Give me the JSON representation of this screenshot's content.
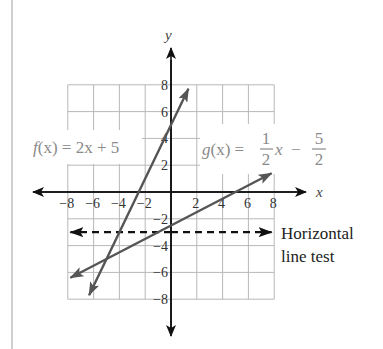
{
  "chart_data": {
    "type": "line",
    "title": "",
    "xlabel": "x",
    "ylabel": "y",
    "xlim": [
      -8,
      8
    ],
    "ylim": [
      -8,
      8
    ],
    "grid": true,
    "x_ticks": [
      "-8",
      "-6",
      "-4",
      "-2",
      "2",
      "4",
      "6",
      "8"
    ],
    "y_ticks": [
      "8",
      "6",
      "4",
      "2",
      "-2",
      "-4",
      "-6",
      "-8"
    ],
    "series": [
      {
        "name": "f(x) = 2x + 5",
        "slope": 2,
        "intercept": 5,
        "x_range": [
          -6.35,
          1.35
        ],
        "style": "solid arrows"
      },
      {
        "name": "g(x) = 1/2 x - 5/2",
        "slope": 0.5,
        "intercept": -2.5,
        "x_range": [
          -7.8,
          7.8
        ],
        "style": "solid arrows"
      },
      {
        "name": "Horizontal line test",
        "y": -3,
        "x_range": [
          -7.8,
          7.8
        ],
        "style": "dashed arrows"
      }
    ],
    "annotations": [
      {
        "text": "f(x) = 2x + 5",
        "position": "upper-left"
      },
      {
        "text": "g(x) = 1/2 x - 5/2",
        "position": "upper-right"
      },
      {
        "text": "Horizontal line test",
        "position": "right of dashed line"
      }
    ]
  },
  "labels": {
    "x_axis": "x",
    "y_axis": "y",
    "f_prefix": "f",
    "f_arg": "(x)",
    "f_rest": " = 2x + 5",
    "g_prefix": "g",
    "g_arg": "(x)",
    "g_eq": " = ",
    "g_frac1_num": "1",
    "g_frac1_den": "2",
    "g_x": "x",
    "g_minus": "−",
    "g_frac2_num": "5",
    "g_frac2_den": "2",
    "hlt_line1": "Horizontal",
    "hlt_line2": "line test"
  },
  "ticks": {
    "x": [
      {
        "v": -8,
        "t": "−8"
      },
      {
        "v": -6,
        "t": "−6"
      },
      {
        "v": -4,
        "t": "−4"
      },
      {
        "v": -2,
        "t": "−2"
      },
      {
        "v": 2,
        "t": "2"
      },
      {
        "v": 4,
        "t": "4"
      },
      {
        "v": 6,
        "t": "6"
      },
      {
        "v": 8,
        "t": "8"
      }
    ],
    "y": [
      {
        "v": 8,
        "t": "8"
      },
      {
        "v": 6,
        "t": "6"
      },
      {
        "v": 4,
        "t": "4"
      },
      {
        "v": 2,
        "t": "2"
      },
      {
        "v": -2,
        "t": "−2"
      },
      {
        "v": -4,
        "t": "−4"
      },
      {
        "v": -6,
        "t": "−6"
      },
      {
        "v": -8,
        "t": "−8"
      }
    ]
  },
  "colors": {
    "grid": "#b8b8b8",
    "axis": "#111111",
    "line": "#555555",
    "dashed": "#111111",
    "function_label": "#8a8a8a"
  }
}
